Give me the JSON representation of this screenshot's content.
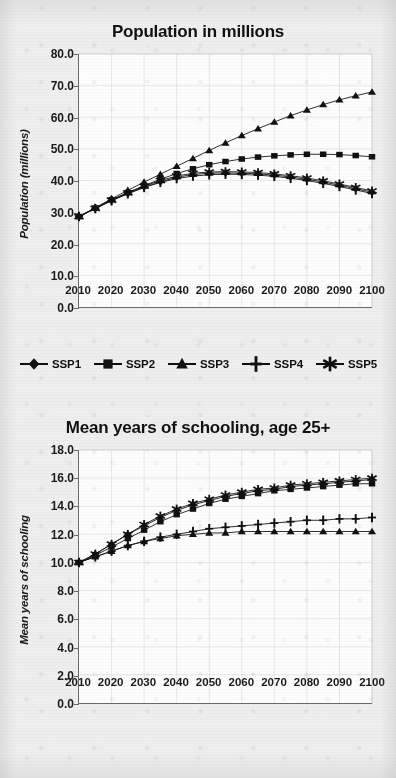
{
  "page": {
    "background_color": "#eeeeee",
    "ink_color": "#111111",
    "plot_background": "#fdfdfd",
    "grid_color": "#c9c9c9",
    "axis_color": "#6b6b6b"
  },
  "legend": {
    "position": "below-first-chart",
    "items": [
      {
        "label": "SSP1",
        "marker": "diamond"
      },
      {
        "label": "SSP2",
        "marker": "square"
      },
      {
        "label": "SSP3",
        "marker": "triangle"
      },
      {
        "label": "SSP4",
        "marker": "plus"
      },
      {
        "label": "SSP5",
        "marker": "asterisk"
      }
    ]
  },
  "chart_data": [
    {
      "id": "population",
      "type": "line",
      "title": "Population in millions",
      "xlabel": "",
      "ylabel": "Population (millions)",
      "x": [
        2010,
        2015,
        2020,
        2025,
        2030,
        2035,
        2040,
        2045,
        2050,
        2055,
        2060,
        2065,
        2070,
        2075,
        2080,
        2085,
        2090,
        2095,
        2100
      ],
      "tick_x": [
        2010,
        2020,
        2030,
        2040,
        2050,
        2060,
        2070,
        2080,
        2090,
        2100
      ],
      "tick_y": [
        "0.0",
        "10.0",
        "20.0",
        "30.0",
        "40.0",
        "50.0",
        "60.0",
        "70.0",
        "80.0"
      ],
      "xlim": [
        2010,
        2100
      ],
      "ylim": [
        0,
        80
      ],
      "grid": true,
      "series": [
        {
          "name": "SSP1",
          "marker": "diamond",
          "values": [
            28.6,
            31.2,
            33.7,
            35.9,
            37.9,
            39.6,
            41.0,
            41.9,
            42.3,
            42.4,
            42.3,
            42.1,
            41.7,
            41.1,
            40.4,
            39.5,
            38.5,
            37.4,
            36.3
          ]
        },
        {
          "name": "SSP2",
          "marker": "square",
          "values": [
            28.6,
            31.3,
            33.9,
            36.2,
            38.4,
            40.4,
            42.2,
            43.7,
            45.0,
            46.0,
            46.8,
            47.4,
            47.8,
            48.1,
            48.3,
            48.3,
            48.2,
            47.9,
            47.5
          ]
        },
        {
          "name": "SSP3",
          "marker": "triangle",
          "values": [
            28.6,
            31.4,
            34.2,
            36.9,
            39.5,
            42.0,
            44.5,
            47.0,
            49.5,
            51.9,
            54.2,
            56.4,
            58.5,
            60.5,
            62.3,
            64.0,
            65.5,
            66.8,
            68.0
          ]
        },
        {
          "name": "SSP4",
          "marker": "plus",
          "values": [
            28.6,
            31.1,
            33.6,
            35.8,
            37.8,
            39.4,
            40.6,
            41.4,
            41.8,
            42.0,
            41.9,
            41.7,
            41.3,
            40.7,
            40.0,
            39.1,
            38.1,
            37.0,
            35.9
          ]
        },
        {
          "name": "SSP5",
          "marker": "asterisk",
          "values": [
            28.6,
            31.2,
            33.8,
            36.1,
            38.2,
            40.0,
            41.4,
            42.3,
            42.7,
            42.8,
            42.7,
            42.5,
            42.1,
            41.5,
            40.8,
            39.9,
            38.9,
            37.8,
            36.7
          ]
        }
      ]
    },
    {
      "id": "schooling",
      "type": "line",
      "title": "Mean years of schooling, age 25+",
      "xlabel": "",
      "ylabel": "Mean years of schooling",
      "x": [
        2010,
        2015,
        2020,
        2025,
        2030,
        2035,
        2040,
        2045,
        2050,
        2055,
        2060,
        2065,
        2070,
        2075,
        2080,
        2085,
        2090,
        2095,
        2100
      ],
      "tick_x": [
        2010,
        2020,
        2030,
        2040,
        2050,
        2060,
        2070,
        2080,
        2090,
        2100
      ],
      "tick_y": [
        "0.0",
        "2.0",
        "4.0",
        "6.0",
        "8.0",
        "10.0",
        "12.0",
        "14.0",
        "16.0",
        "18.0"
      ],
      "xlim": [
        2010,
        2100
      ],
      "ylim": [
        0,
        18
      ],
      "grid": true,
      "series": [
        {
          "name": "SSP1",
          "marker": "diamond",
          "values": [
            10.0,
            10.6,
            11.3,
            12.0,
            12.6,
            13.2,
            13.7,
            14.1,
            14.4,
            14.7,
            14.9,
            15.1,
            15.2,
            15.4,
            15.5,
            15.6,
            15.7,
            15.8,
            15.9
          ]
        },
        {
          "name": "SSP2",
          "marker": "square",
          "values": [
            10.0,
            10.5,
            11.1,
            11.7,
            12.3,
            12.9,
            13.4,
            13.8,
            14.2,
            14.5,
            14.7,
            14.9,
            15.1,
            15.2,
            15.3,
            15.4,
            15.5,
            15.6,
            15.6
          ]
        },
        {
          "name": "SSP3",
          "marker": "triangle",
          "values": [
            10.0,
            10.4,
            10.8,
            11.2,
            11.5,
            11.7,
            11.9,
            12.0,
            12.1,
            12.1,
            12.2,
            12.2,
            12.2,
            12.2,
            12.2,
            12.2,
            12.2,
            12.2,
            12.2
          ]
        },
        {
          "name": "SSP4",
          "marker": "plus",
          "values": [
            10.0,
            10.4,
            10.8,
            11.2,
            11.5,
            11.8,
            12.0,
            12.2,
            12.4,
            12.5,
            12.6,
            12.7,
            12.8,
            12.9,
            13.0,
            13.0,
            13.1,
            13.1,
            13.2
          ]
        },
        {
          "name": "SSP5",
          "marker": "asterisk",
          "values": [
            10.0,
            10.6,
            11.3,
            12.0,
            12.7,
            13.3,
            13.8,
            14.2,
            14.5,
            14.8,
            15.0,
            15.2,
            15.3,
            15.5,
            15.6,
            15.7,
            15.8,
            15.9,
            16.0
          ]
        }
      ]
    }
  ]
}
